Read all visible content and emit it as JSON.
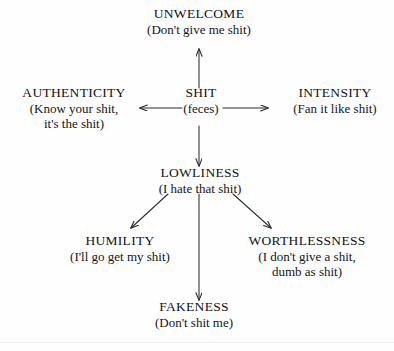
{
  "diagram": {
    "type": "concept-map",
    "title_visible": false,
    "stroke_color": "#2b2b2b",
    "text_color": "#111111",
    "background_color": "#ffffff",
    "nodes": [
      {
        "id": "unwelcome",
        "title": "UNWELCOME",
        "gloss": "(Don't give me shit)",
        "gloss2": "",
        "position": "top"
      },
      {
        "id": "authenticity",
        "title": "AUTHENTICITY",
        "gloss": "(Know your shit,",
        "gloss2": "it's the shit)",
        "position": "middle-left"
      },
      {
        "id": "shit",
        "title": "SHIT",
        "gloss": "(feces)",
        "gloss2": "",
        "position": "center"
      },
      {
        "id": "intensity",
        "title": "INTENSITY",
        "gloss": "(Fan it like shit)",
        "gloss2": "",
        "position": "middle-right"
      },
      {
        "id": "lowliness",
        "title": "LOWLINESS",
        "gloss": "(I hate that shit)",
        "gloss2": "",
        "position": "center-lower"
      },
      {
        "id": "humility",
        "title": "HUMILITY",
        "gloss": "(I'll go get my shit)",
        "gloss2": "",
        "position": "bottom-left"
      },
      {
        "id": "worthlessness",
        "title": "WORTHLESSNESS",
        "gloss": "(I don't give a shit,",
        "gloss2": "dumb as shit)",
        "position": "bottom-right"
      },
      {
        "id": "fakeness",
        "title": "FAKENESS",
        "gloss": "(Don't shit me)",
        "gloss2": "",
        "position": "bottom-center"
      }
    ],
    "edges": [
      {
        "from": "shit",
        "to": "unwelcome",
        "direction": "up"
      },
      {
        "from": "shit",
        "to": "authenticity",
        "direction": "left"
      },
      {
        "from": "shit",
        "to": "intensity",
        "direction": "right"
      },
      {
        "from": "shit",
        "to": "lowliness",
        "direction": "down"
      },
      {
        "from": "lowliness",
        "to": "humility",
        "direction": "down-left"
      },
      {
        "from": "lowliness",
        "to": "fakeness",
        "direction": "down"
      },
      {
        "from": "lowliness",
        "to": "worthlessness",
        "direction": "down-right"
      }
    ]
  }
}
